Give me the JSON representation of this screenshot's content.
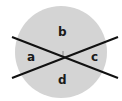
{
  "diagram": {
    "circle": {
      "cx": 61,
      "cy": 52,
      "r": 46,
      "fill": "#d4d4d4"
    },
    "lines": [
      {
        "x1": 12,
        "y1": 37,
        "x2": 118,
        "y2": 78,
        "color": "#111111"
      },
      {
        "x1": 12,
        "y1": 78,
        "x2": 118,
        "y2": 37,
        "color": "#111111"
      }
    ],
    "center_mark": {
      "x": 63,
      "y": 54,
      "color": "#888888"
    },
    "labels": {
      "a": "a",
      "b": "b",
      "c": "c",
      "d": "d"
    }
  }
}
